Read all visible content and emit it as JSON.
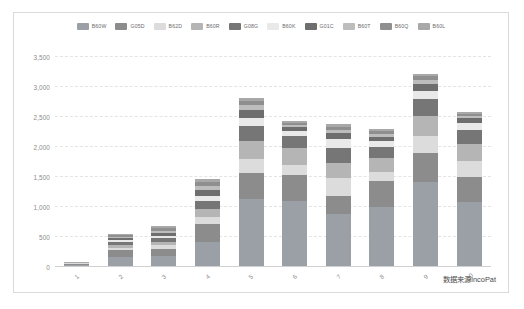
{
  "chart_data": {
    "type": "bar",
    "stacked": true,
    "title": "",
    "subtitle": "",
    "xlabel": "",
    "ylabel": "",
    "ylim": [
      0,
      3500
    ],
    "ytick_labels": [
      "0",
      "500",
      "1,000",
      "1,500",
      "2,000",
      "2,500",
      "3,000",
      "3,500"
    ],
    "ytick_values": [
      0,
      500,
      1000,
      1500,
      2000,
      2500,
      3000,
      3500
    ],
    "grid": true,
    "legend_position": "top",
    "categories": [
      "1",
      "2",
      "3",
      "4",
      "5",
      "6",
      "7",
      "8",
      "9",
      "10"
    ],
    "totals": [
      60,
      530,
      670,
      1450,
      2800,
      2420,
      2360,
      2290,
      3200,
      2570
    ],
    "series": [
      {
        "name": "B60W",
        "color": "#9aa0a6",
        "values": [
          22,
          150,
          170,
          400,
          1120,
          1080,
          860,
          980,
          1400,
          1060
        ]
      },
      {
        "name": "G05D",
        "color": "#8c8c8c",
        "values": [
          16,
          110,
          120,
          300,
          430,
          430,
          300,
          440,
          480,
          420
        ]
      },
      {
        "name": "B62D",
        "color": "#dcdcdc",
        "values": [
          6,
          45,
          55,
          120,
          230,
          170,
          300,
          150,
          290,
          270
        ]
      },
      {
        "name": "B60R",
        "color": "#b5b5b5",
        "values": [
          5,
          50,
          60,
          130,
          300,
          290,
          260,
          230,
          330,
          290
        ]
      },
      {
        "name": "G08G",
        "color": "#767676",
        "values": [
          4,
          45,
          60,
          130,
          250,
          200,
          240,
          190,
          280,
          230
        ]
      },
      {
        "name": "B60K",
        "color": "#e9e9e9",
        "values": [
          2,
          30,
          40,
          90,
          140,
          80,
          160,
          90,
          140,
          110
        ]
      },
      {
        "name": "G01C",
        "color": "#6e6e6e",
        "values": [
          2,
          35,
          45,
          90,
          130,
          60,
          100,
          70,
          110,
          80
        ]
      },
      {
        "name": "B60T",
        "color": "#bdbdbd",
        "values": [
          1,
          25,
          40,
          70,
          80,
          40,
          50,
          50,
          70,
          40
        ]
      },
      {
        "name": "B60Q",
        "color": "#8f8f8f",
        "values": [
          1,
          20,
          40,
          70,
          70,
          40,
          50,
          50,
          60,
          40
        ]
      },
      {
        "name": "B60L",
        "color": "#a8a8a8",
        "values": [
          1,
          20,
          40,
          50,
          50,
          30,
          40,
          40,
          40,
          30
        ]
      }
    ],
    "annotation": "数据来源incoPat"
  },
  "legend": {
    "items": [
      {
        "label": "B60W"
      },
      {
        "label": "G05D"
      },
      {
        "label": "B62D"
      },
      {
        "label": "B60R"
      },
      {
        "label": "G08G"
      },
      {
        "label": "B60K"
      },
      {
        "label": "G01C"
      },
      {
        "label": "B60T"
      },
      {
        "label": "B60Q"
      },
      {
        "label": "B60L"
      }
    ]
  },
  "footer": {
    "source": "数据来源incoPat"
  }
}
